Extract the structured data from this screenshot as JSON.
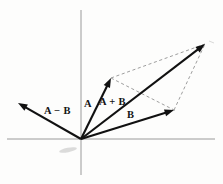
{
  "figure": {
    "background_color": "#fdfdfc",
    "width": 223,
    "height": 184
  },
  "axes": {
    "color": "#9a9a9a",
    "origin": {
      "x": 81,
      "y": 139
    },
    "horizontal": {
      "x1": 7,
      "y1": 139,
      "x2": 215,
      "y2": 139
    },
    "vertical": {
      "x1": 81,
      "y1": 10,
      "x2": 81,
      "y2": 175
    }
  },
  "chart_data": {
    "type": "diagram",
    "xlabel": "",
    "ylabel": "",
    "grid": false,
    "legend": "none",
    "origin": {
      "x": 81,
      "y": 139
    },
    "vectors": [
      {
        "name": "A",
        "label": "A",
        "color": "#111111",
        "style": "solid",
        "from": {
          "x": 81,
          "y": 139
        },
        "to": {
          "x": 111,
          "y": 78
        },
        "components": {
          "dx": 30,
          "dy": -61
        },
        "label_position": {
          "x": 86,
          "y": 99
        }
      },
      {
        "name": "A+B",
        "label": "A + B",
        "color": "#111111",
        "style": "solid",
        "from": {
          "x": 81,
          "y": 139
        },
        "to": {
          "x": 205,
          "y": 44
        },
        "components": {
          "dx": 124,
          "dy": -95
        },
        "label_position": {
          "x": 101,
          "y": 97
        }
      },
      {
        "name": "B",
        "label": "B",
        "color": "#111111",
        "style": "solid",
        "from": {
          "x": 81,
          "y": 139
        },
        "to": {
          "x": 174,
          "y": 110
        },
        "components": {
          "dx": 93,
          "dy": -29
        },
        "label_position": {
          "x": 127,
          "y": 110
        }
      },
      {
        "name": "A-B",
        "label": "A − B",
        "color": "#111111",
        "style": "solid",
        "from": {
          "x": 81,
          "y": 139
        },
        "to": {
          "x": 18,
          "y": 103
        },
        "components": {
          "dx": -63,
          "dy": -36
        },
        "label_position": {
          "x": 44,
          "y": 106
        }
      }
    ],
    "construction_lines": [
      {
        "name": "a-tip-to-sum",
        "style": "dashed",
        "color": "#8d8d8d",
        "from": {
          "x": 111,
          "y": 78
        },
        "to": {
          "x": 205,
          "y": 44
        }
      },
      {
        "name": "b-tip-to-sum",
        "style": "dashed",
        "color": "#8d8d8d",
        "from": {
          "x": 174,
          "y": 110
        },
        "to": {
          "x": 205,
          "y": 44
        }
      },
      {
        "name": "a-tip-to-b-tip-diagonal",
        "style": "dashed",
        "color": "#8d8d8d",
        "from": {
          "x": 111,
          "y": 78
        },
        "to": {
          "x": 176,
          "y": 111
        }
      }
    ],
    "annotations": [
      {
        "text": "A",
        "x": 86,
        "y": 99
      },
      {
        "text": "A + B",
        "x": 101,
        "y": 97
      },
      {
        "text": "B",
        "x": 127,
        "y": 110
      },
      {
        "text": "A − B",
        "x": 44,
        "y": 106
      }
    ]
  },
  "labels": {
    "a": "A",
    "a_plus_b": "A + B",
    "b": "B",
    "a_minus_b": "A − B"
  }
}
